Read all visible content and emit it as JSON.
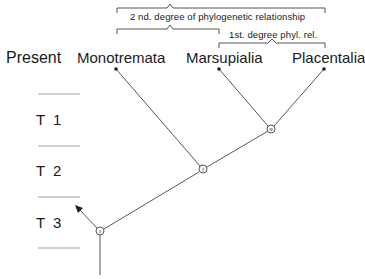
{
  "diagram": {
    "type": "phylogenetic-tree",
    "present_label": "Present",
    "taxa": [
      {
        "name": "Monotremata",
        "x": 116,
        "y": 69
      },
      {
        "name": "Marsupialia",
        "x": 219,
        "y": 69
      },
      {
        "name": "Placentalia",
        "x": 324,
        "y": 69
      }
    ],
    "nodes": [
      {
        "id": "w",
        "label": "w",
        "x": 271,
        "y": 129
      },
      {
        "id": "y",
        "label": "y",
        "x": 203,
        "y": 169
      },
      {
        "id": "x",
        "label": "x",
        "x": 100,
        "y": 231
      }
    ],
    "brackets": {
      "second_degree": "2 nd. degree of phylogenetic relationship",
      "first_degree": "1st. degree phyl. rel."
    },
    "time_periods": [
      "T 1",
      "T 2",
      "T 3"
    ],
    "colors": {
      "line": "#333333",
      "tick": "#888888",
      "text": "#1a1a1a"
    }
  }
}
